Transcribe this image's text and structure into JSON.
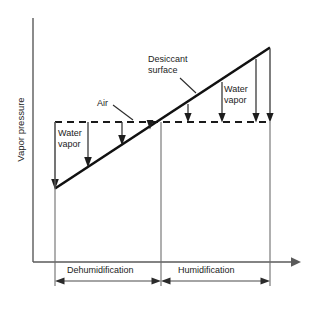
{
  "figure": {
    "type": "schematic-line-diagram",
    "title": "",
    "axes": {
      "y_label": "Vapor pressure",
      "x_label": "",
      "y_axis_x": 33,
      "y_axis_top": 18,
      "x_axis_y": 262,
      "x_axis_left": 33,
      "x_axis_right": 295,
      "ticks": [],
      "grid": false
    },
    "series": [
      {
        "name": "Desiccant surface",
        "style": "solid",
        "points": [
          [
            55,
            188
          ],
          [
            270,
            48
          ]
        ],
        "label": "Desiccant surface"
      },
      {
        "name": "Air",
        "style": "dashed",
        "points": [
          [
            55,
            122
          ],
          [
            270,
            122
          ]
        ],
        "label": "Air"
      }
    ],
    "crossing_point": [
      161,
      122
    ],
    "vapor_arrows": {
      "dehumidification": {
        "direction": "down-to-desiccant",
        "x_positions": [
          55,
          88,
          122,
          150
        ],
        "from_y": 122
      },
      "humidification": {
        "direction": "down-to-air",
        "x_positions": [
          188,
          222,
          256,
          270
        ],
        "to_y": 122
      }
    },
    "labels": {
      "y_axis": "Vapor pressure",
      "water_vapor_left": "Water\nvapor",
      "water_vapor_right": "Water\nvapor",
      "air": "Air",
      "desiccant_surface": "Desiccant\nsurface",
      "dehumidification": "Dehumidification",
      "humidification": "Humidification"
    },
    "regions": [
      {
        "name": "dehumidification",
        "label": "Dehumidification",
        "x_start": 55,
        "x_end": 161
      },
      {
        "name": "humidification",
        "label": "Humidification",
        "x_start": 161,
        "x_end": 270
      }
    ],
    "colors": {
      "background": "#ffffff",
      "line": "#111111",
      "axis": "#5a5a5a",
      "text": "#1b1b1b"
    }
  }
}
